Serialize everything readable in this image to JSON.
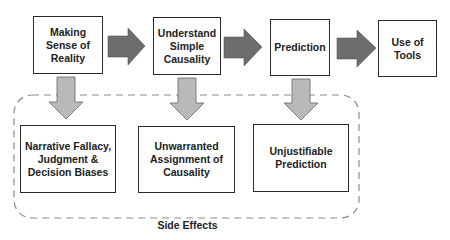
{
  "diagram": {
    "top_row": [
      {
        "id": "making-sense",
        "label": "Making\nSense of\nReality"
      },
      {
        "id": "understand-causality",
        "label": "Understand\nSimple\nCausality"
      },
      {
        "id": "prediction",
        "label": "Prediction"
      },
      {
        "id": "use-of-tools",
        "label": "Use of\nTools"
      }
    ],
    "bottom_row": [
      {
        "id": "narrative-fallacy",
        "label": "Narrative Fallacy,\nJudgment &\nDecision Biases"
      },
      {
        "id": "unwarranted-causality",
        "label": "Unwarranted\nAssignment of\nCausality"
      },
      {
        "id": "unjustifiable-prediction",
        "label": "Unjustifiable\nPrediction"
      }
    ],
    "group_label": "Side Effects",
    "colors": {
      "right_arrow": "#6d6d6d",
      "down_arrow": "#b9b9b9",
      "border": "#2a2a2a",
      "dashed": "#8a8a8a"
    }
  }
}
